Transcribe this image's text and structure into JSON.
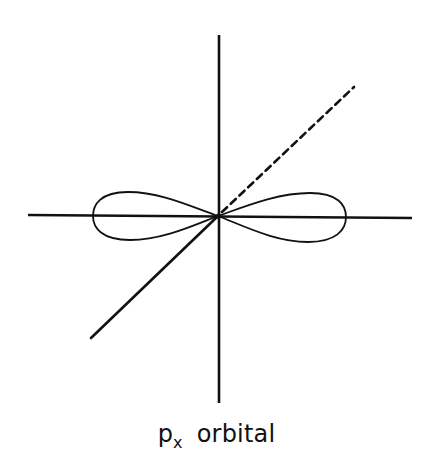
{
  "diagram": {
    "orbital": {
      "symbol_main": "p",
      "symbol_sub": "x",
      "word": "orbital"
    },
    "axes": [
      {
        "name": "z-axis",
        "style": "solid",
        "direction": "vertical"
      },
      {
        "name": "x-axis",
        "style": "solid",
        "direction": "horizontal"
      },
      {
        "name": "y-axis-front",
        "style": "solid",
        "direction": "diagonal-lower-left"
      },
      {
        "name": "y-axis-back",
        "style": "dashed",
        "direction": "diagonal-upper-right"
      }
    ],
    "lobes": [
      {
        "name": "left-lobe",
        "along": "x-axis",
        "side": "negative"
      },
      {
        "name": "right-lobe",
        "along": "x-axis",
        "side": "positive"
      }
    ],
    "colors": {
      "line": "#111111",
      "background": "#ffffff"
    }
  }
}
